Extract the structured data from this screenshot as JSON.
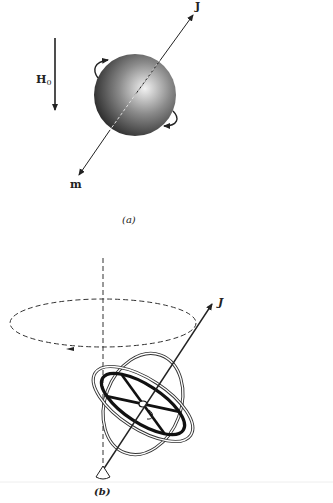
{
  "panel_a": {
    "caption": "(a)",
    "field_label": "H",
    "field_subscript": "0",
    "angular_momentum_label": "J",
    "magnetic_moment_label": "m",
    "sphere_shading": [
      "#f2f2f2",
      "#8a8a8a",
      "#1e1e1e"
    ]
  },
  "panel_b": {
    "caption": "(b)",
    "angular_momentum_label": "J"
  },
  "colors": {
    "ink": "#222222",
    "background": "#ffffff"
  }
}
